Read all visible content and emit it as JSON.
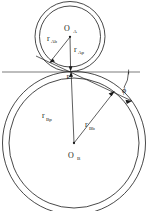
{
  "diagram": {
    "type": "engineering-line-diagram",
    "background_color": "#ffffff",
    "line_color": "#1a1a1a",
    "labels": {
      "gear_a_center": "O",
      "gear_a_center_sub": "A",
      "gear_b_center": "O",
      "gear_b_center_sub": "B",
      "pitch_point": "P",
      "pressure_angle": "ϕ",
      "r_a_base": "r",
      "r_a_base_sub": "Ab",
      "r_a_pitch": "r",
      "r_a_pitch_sub": "Ap",
      "r_b_pitch": "r",
      "r_b_pitch_sub": "Bp",
      "r_b_base": "r",
      "r_b_base_sub": "Bb"
    },
    "geometry": {
      "gear_a": {
        "center_x": 70,
        "center_y": 36,
        "pitch_radius": 34.5,
        "base_radius": 30.5
      },
      "gear_b": {
        "center_x": 74,
        "center_y": 145,
        "pitch_radius": 70.5,
        "base_radius": 65.0
      },
      "pitch_point_x": 70,
      "pitch_point_y": 71,
      "pressure_angle_degrees": 25,
      "tangent_line_y": 76
    }
  }
}
